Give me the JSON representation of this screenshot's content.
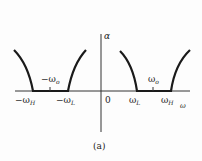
{
  "diagram": {
    "caption": "(a)",
    "axis_label_y": "α",
    "origin_label": "0",
    "labels": {
      "neg_omega_o": {
        "base": "−ω",
        "sub": "o"
      },
      "neg_omega_H": {
        "base": "−ω",
        "sub": "H"
      },
      "neg_omega_L": {
        "base": "−ω",
        "sub": "L"
      },
      "omega_L": {
        "base": "ω",
        "sub": "L"
      },
      "omega_o": {
        "base": "ω",
        "sub": "o"
      },
      "omega_H": {
        "base": "ω",
        "sub": "H"
      },
      "omega_axis": "ω"
    },
    "colors": {
      "curve": "#1a1a1a",
      "axis": "#333333",
      "text": "#222222"
    }
  }
}
